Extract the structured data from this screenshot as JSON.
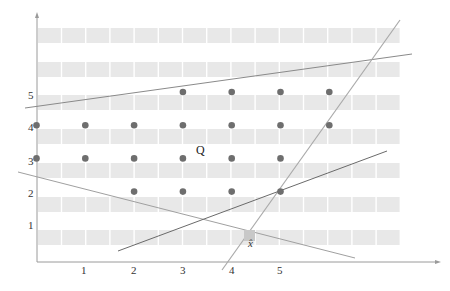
{
  "diagram": {
    "type": "integer-lattice-polyhedron",
    "axes": {
      "x_ticks": [
        "1",
        "2",
        "3",
        "4",
        "5"
      ],
      "y_ticks": [
        "1",
        "2",
        "3",
        "4",
        "5"
      ]
    },
    "region_label": "Q",
    "point_label": "x̂",
    "colors": {
      "band": "#e8e8e8",
      "point": "#6e6e6e",
      "axis": "#9a9a9a",
      "line_light": "#a8a8a8",
      "line_dark": "#6a6a6a",
      "xhat_marker": "#c8c8c8"
    },
    "lattice_points": [
      {
        "x": 3,
        "y": 5
      },
      {
        "x": 4,
        "y": 5
      },
      {
        "x": 5,
        "y": 5
      },
      {
        "x": 6,
        "y": 5
      },
      {
        "x": 0,
        "y": 4
      },
      {
        "x": 1,
        "y": 4
      },
      {
        "x": 2,
        "y": 4
      },
      {
        "x": 3,
        "y": 4
      },
      {
        "x": 4,
        "y": 4
      },
      {
        "x": 5,
        "y": 4
      },
      {
        "x": 6,
        "y": 4
      },
      {
        "x": 0,
        "y": 3
      },
      {
        "x": 1,
        "y": 3
      },
      {
        "x": 2,
        "y": 3
      },
      {
        "x": 3,
        "y": 3
      },
      {
        "x": 4,
        "y": 3
      },
      {
        "x": 5,
        "y": 3
      },
      {
        "x": 2,
        "y": 2
      },
      {
        "x": 3,
        "y": 2
      },
      {
        "x": 4,
        "y": 2
      },
      {
        "x": 5,
        "y": 2
      }
    ],
    "constraint_lines": [
      {
        "name": "upper",
        "from": [
          -0.25,
          4.5
        ],
        "to": [
          7.7,
          6.2
        ]
      },
      {
        "name": "steep",
        "from": [
          3.8,
          -0.3
        ],
        "to": [
          7.4,
          7.3
        ]
      },
      {
        "name": "descending",
        "from": [
          -0.4,
          2.6
        ],
        "to": [
          6.5,
          -0.1
        ]
      },
      {
        "name": "rising",
        "from": [
          1.7,
          0.3
        ],
        "to": [
          7.2,
          3.2
        ]
      }
    ]
  }
}
